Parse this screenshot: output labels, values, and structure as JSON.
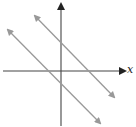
{
  "diagram": {
    "type": "coordinate-plane",
    "axes": {
      "x_label": "x",
      "y_label": "",
      "color": "#333333"
    },
    "lines": [
      {
        "name": "upper-right-line",
        "description": "parallel line with negative slope, y-intercept above origin, two-headed arrow",
        "color": "#999999"
      },
      {
        "name": "lower-left-line",
        "description": "parallel line with negative slope, y-intercept below origin, two-headed arrow",
        "color": "#999999"
      }
    ],
    "note": "Two parallel lines with the same negative slope"
  }
}
